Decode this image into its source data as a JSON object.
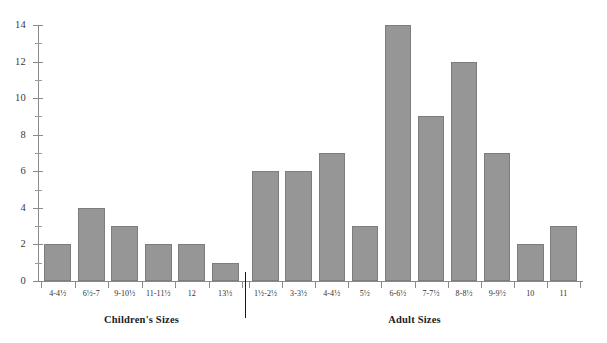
{
  "chart_data": {
    "type": "bar",
    "title": "",
    "xlabel": "",
    "ylabel": "",
    "ylim": [
      0,
      14
    ],
    "y_ticks_major": [
      0,
      2,
      4,
      6,
      8,
      10,
      12,
      14
    ],
    "y_ticks_minor": [
      1,
      3,
      5,
      7,
      9,
      11,
      13
    ],
    "grid": false,
    "legend": "none",
    "groups": [
      {
        "name": "Children's Sizes",
        "caption": "Children's Sizes",
        "categories": [
          "4-4½",
          "6½-7",
          "9-10½",
          "11-11½",
          "12",
          "13½"
        ],
        "values": [
          2,
          4,
          3,
          2,
          2,
          1
        ]
      },
      {
        "name": "Adult Sizes",
        "caption": "Adult Sizes",
        "categories": [
          "1½-2½",
          "3-3½",
          "4-4½",
          "5½",
          "6-6½",
          "7-7½",
          "8-8½",
          "9-9½",
          "10",
          "11"
        ],
        "values": [
          6,
          6,
          7,
          3,
          14,
          9,
          12,
          7,
          2,
          3
        ]
      }
    ],
    "categories": [
      "4-4½",
      "6½-7",
      "9-10½",
      "11-11½",
      "12",
      "13½",
      "1½-2½",
      "3-3½",
      "4-4½",
      "5½",
      "6-6½",
      "7-7½",
      "8-8½",
      "9-9½",
      "10",
      "11"
    ],
    "values": [
      2,
      4,
      3,
      2,
      2,
      1,
      6,
      6,
      7,
      3,
      14,
      9,
      12,
      7,
      2,
      3
    ],
    "colors": {
      "bar_fill": "#969696",
      "bar_stroke": "#7d7d7d",
      "axis": "#8a8a8a",
      "divider": "#1a1a1a",
      "text": "#2f2f2f",
      "background": "#ffffff"
    }
  }
}
